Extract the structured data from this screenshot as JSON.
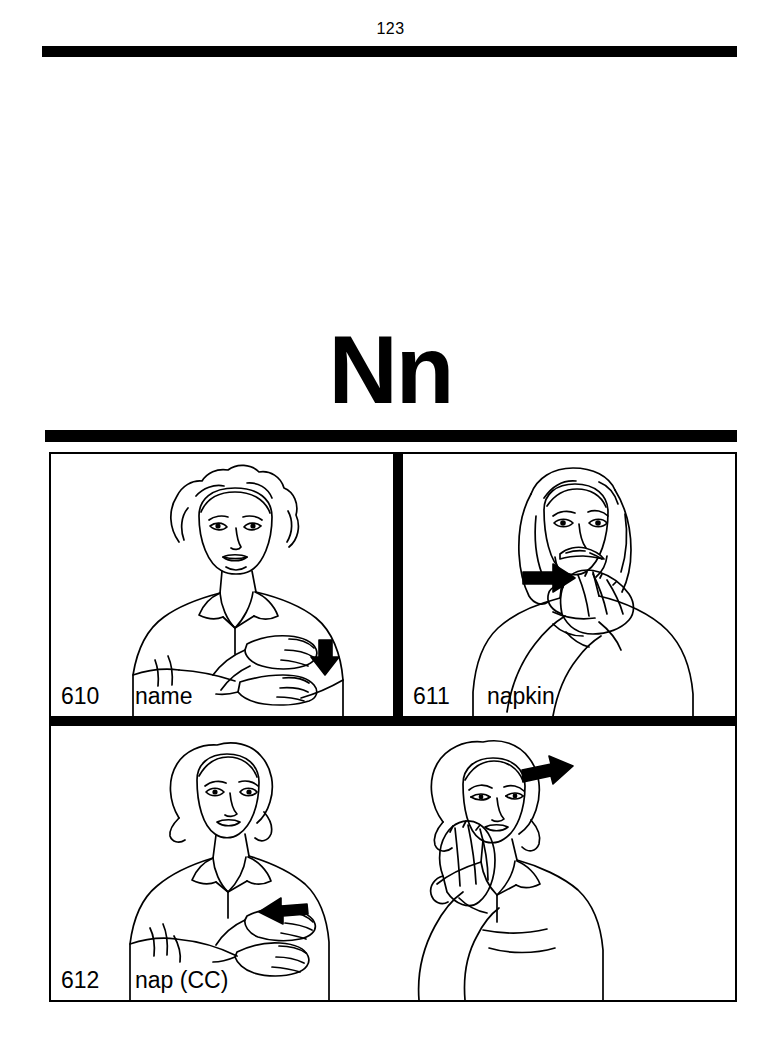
{
  "page": {
    "number": "123",
    "letter_heading": "Nn",
    "background_color": "#ffffff",
    "ink_color": "#000000"
  },
  "panels": [
    {
      "id": "610",
      "number": "610",
      "word": "name",
      "illustration": "woman-signing-name",
      "description": "Woman with curly hair, two H-hands crossed at chest with downward arrow"
    },
    {
      "id": "611",
      "number": "611",
      "word": "napkin",
      "illustration": "man-signing-napkin",
      "description": "Man with long hair and mustache, flat hand wiping across mouth with rightward arrow"
    },
    {
      "id": "612",
      "number": "612",
      "word": "nap (CC)",
      "illustration": "two-women-signing-nap",
      "description": "Left: woman signing sleep-short at chest with leftward arrow. Right: woman resting cheek on flat hand with arrow above head"
    }
  ]
}
